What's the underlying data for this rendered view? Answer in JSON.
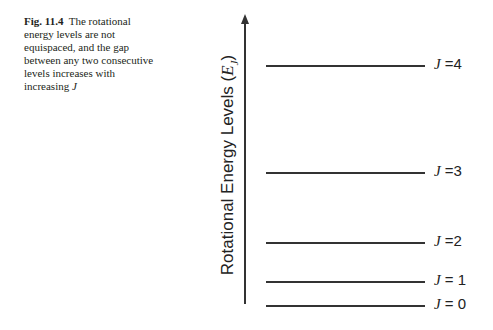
{
  "caption": {
    "fig_label": "Fig. 11.4",
    "text": "The rotational energy levels are not equispaced, and the gap between any two consecutive levels increases with increasing",
    "symbol": "J"
  },
  "diagram": {
    "y_axis_label": "Rotational Energy Levels",
    "y_axis_symbol": "E",
    "y_axis_subscript": "J",
    "levels": [
      {
        "j": "J",
        "eq": " =4",
        "y": 65
      },
      {
        "j": "J",
        "eq": " =3",
        "y": 172
      },
      {
        "j": "J",
        "eq": " =2",
        "y": 242
      },
      {
        "j": "J",
        "eq": " = 1",
        "y": 281
      },
      {
        "j": "J",
        "eq": " = 0",
        "y": 305
      }
    ]
  }
}
